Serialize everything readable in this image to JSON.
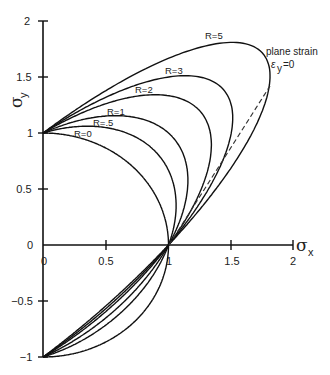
{
  "chart_data": {
    "type": "line",
    "title": "",
    "xlabel": "σx",
    "ylabel": "σy",
    "xlim": [
      0,
      2
    ],
    "ylim": [
      -1,
      2
    ],
    "grid": false,
    "legend": "none (curves labeled inline)",
    "x_ticks": [
      "0",
      "0.5",
      "1",
      "1.5",
      "2"
    ],
    "y_ticks": [
      "-1",
      "-0.5",
      "0",
      "0.5",
      "1",
      "1.5",
      "2"
    ],
    "equation": "σx² − (2R/(1+R))·σx·σy + σy² = 1",
    "series": [
      {
        "name": "R=0",
        "R": 0
      },
      {
        "name": "R=.5",
        "R": 0.5
      },
      {
        "name": "R=1",
        "R": 1
      },
      {
        "name": "R=2",
        "R": 2
      },
      {
        "name": "R=3",
        "R": 3
      },
      {
        "name": "R=5",
        "R": 5
      }
    ],
    "annotations": [
      {
        "text": "plane strain",
        "x": 1.85,
        "y": 1.55
      },
      {
        "text": "εy=0",
        "x": 1.86,
        "y": 1.42
      },
      {
        "type": "dashed-line",
        "label": "plane strain locus",
        "from": [
          1,
          0
        ],
        "to": [
          1.8,
          1.42
        ]
      }
    ]
  },
  "axis": {
    "x_title_main": "σ",
    "x_title_sub": "x",
    "y_title_main": "σ",
    "y_title_sub": "y"
  },
  "labels": {
    "r0": "R=0",
    "r05": "R=.5",
    "r1": "R=1",
    "r2": "R=2",
    "r3": "R=3",
    "r5": "R=5",
    "plane_strain": "plane strain",
    "eps_main": "ε",
    "eps_sub": "y",
    "eps_tail": "=0"
  },
  "ticks": {
    "x": [
      "0",
      "0.5",
      "1",
      "1.5",
      "2"
    ],
    "y": [
      "2",
      "1.5",
      "1",
      "0.5",
      "0",
      "−0.5",
      "−1"
    ]
  }
}
